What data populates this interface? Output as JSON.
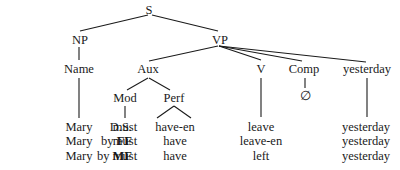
{
  "tree": {
    "nodes": {
      "S": "S",
      "NP": "NP",
      "VP": "VP",
      "Name": "Name",
      "Aux": "Aux",
      "V": "V",
      "Comp": "Comp",
      "yesterday": "yesterday",
      "Mod": "Mod",
      "Perf": "Perf",
      "empty": "∅"
    }
  },
  "rows": [
    {
      "label_prefix": "",
      "label_bold": "",
      "label_plain": "D.S.",
      "cells": [
        "Mary",
        "must",
        "have-en",
        "leave",
        "yesterday"
      ]
    },
    {
      "label_prefix": "by ",
      "label_bold": "FF",
      "label_plain": "",
      "cells": [
        "Mary",
        "must",
        "have",
        "leave-en",
        "yesterday"
      ]
    },
    {
      "label_prefix": "by ",
      "label_bold": "MF",
      "label_plain": "",
      "cells": [
        "Mary",
        "must",
        "have",
        "left",
        "yesterday"
      ]
    }
  ]
}
